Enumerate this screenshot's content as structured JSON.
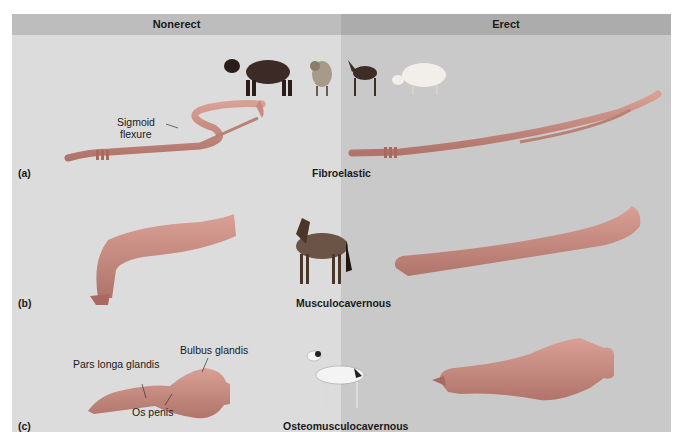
{
  "columns": {
    "left": "Nonerect",
    "right": "Erect"
  },
  "rows": [
    {
      "letter": "(a)",
      "type": "Fibroelastic",
      "animals": [
        "bull",
        "ram",
        "goat",
        "pig"
      ],
      "annotations": [
        "Sigmoid",
        "flexure"
      ]
    },
    {
      "letter": "(b)",
      "type": "Musculocavernous",
      "animals": [
        "horse"
      ],
      "annotations": []
    },
    {
      "letter": "(c)",
      "type": "Osteomusculocavernous",
      "animals": [
        "dog"
      ],
      "annotations": [
        "Pars longa glandis",
        "Bulbus glandis",
        "Os penis"
      ]
    }
  ],
  "colors": {
    "organ": "#c98a7f",
    "organ_dark": "#a86a60",
    "left_bg": "#dcdcdc",
    "right_bg": "#c9c9c9"
  }
}
